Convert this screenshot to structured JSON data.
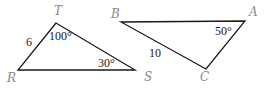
{
  "triangles": [
    {
      "name": "RST",
      "vertices": {
        "T": {
          "label": "T",
          "x": 56,
          "y": 23,
          "lx": 54,
          "ly": 15
        },
        "R": {
          "label": "R",
          "x": 18,
          "y": 70,
          "lx": 7,
          "ly": 82
        },
        "S": {
          "label": "S",
          "x": 135,
          "y": 70,
          "lx": 144,
          "ly": 81
        }
      },
      "side_labels": [
        {
          "side": "RT",
          "text": "6",
          "x": 26,
          "y": 46
        }
      ],
      "angle_labels": [
        {
          "vertex": "T",
          "text": "100°",
          "x": 49,
          "y": 40
        },
        {
          "vertex": "S",
          "text": "30°",
          "x": 98,
          "y": 67
        }
      ]
    },
    {
      "name": "ABC",
      "vertices": {
        "B": {
          "label": "B",
          "x": 121,
          "y": 22,
          "lx": 111,
          "ly": 18
        },
        "A": {
          "label": "A",
          "x": 245,
          "y": 21,
          "lx": 249,
          "ly": 16
        },
        "C": {
          "label": "C",
          "x": 206,
          "y": 69,
          "lx": 200,
          "ly": 81
        }
      },
      "side_labels": [
        {
          "side": "BC",
          "text": "10",
          "x": 149,
          "y": 57
        }
      ],
      "angle_labels": [
        {
          "vertex": "A",
          "text": "50°",
          "x": 215,
          "y": 35
        }
      ]
    }
  ],
  "colors": {
    "edge": "#1a1a1a",
    "vertex_label": "#8a8a8a",
    "measure_label": "#1a1a1a"
  }
}
